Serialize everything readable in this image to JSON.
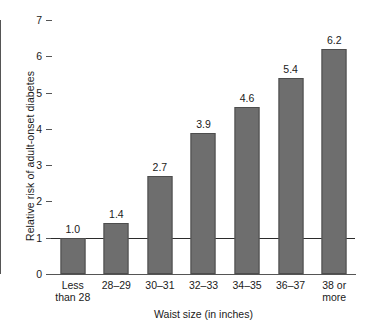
{
  "chart_data": {
    "type": "bar",
    "title": "",
    "categories": [
      "Less than 28",
      "28–29",
      "30–31",
      "32–33",
      "34–35",
      "36–37",
      "38 or more"
    ],
    "category_lines": [
      [
        "Less",
        "than 28"
      ],
      [
        "28–29",
        ""
      ],
      [
        "30–31",
        ""
      ],
      [
        "32–33",
        ""
      ],
      [
        "34–35",
        ""
      ],
      [
        "36–37",
        ""
      ],
      [
        "38 or",
        "more"
      ]
    ],
    "values": [
      1.0,
      1.4,
      2.7,
      3.9,
      4.6,
      5.4,
      6.2
    ],
    "value_labels": [
      "1.0",
      "1.4",
      "2.7",
      "3.9",
      "4.6",
      "5.4",
      "6.2"
    ],
    "xlabel": "Waist size (in inches)",
    "ylabel": "Relative risk of adult-onset diabetes",
    "ylim": [
      0,
      7
    ],
    "yticks": [
      0,
      1,
      2,
      3,
      4,
      5,
      6,
      7
    ],
    "ytick_labels": [
      "0",
      "1",
      "2",
      "3",
      "4",
      "5",
      "6",
      "7"
    ],
    "grid": false,
    "legend": "none",
    "reference_line": {
      "value": 1,
      "color": "#2b2b2b"
    },
    "colors": {
      "bar_fill": "#6e6e6e",
      "bar_border": "#4d4d4d",
      "axis": "#555555",
      "text": "#1a1a1a",
      "background": "#ffffff"
    }
  }
}
